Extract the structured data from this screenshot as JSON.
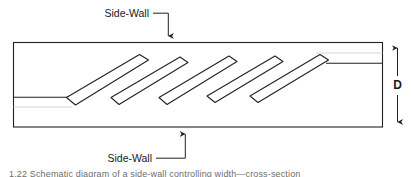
{
  "figure": {
    "type": "technical-line-diagram",
    "background_color": "#ffffff",
    "line_color": "#231f20",
    "faint_line_color": "#cfcfcf",
    "text_color": "#1a1a1a"
  },
  "labels": {
    "top_side_wall": "Side-Wall",
    "bottom_side_wall": "Side-Wall",
    "depth_dimension": "D"
  },
  "caption": {
    "text": "1.22    Schematic diagram of a side-wall controlling width—cross-section",
    "visible": "clipped-at-bottom-edge"
  },
  "geometry": {
    "duct_rect": {
      "x": 13,
      "y": 42,
      "width": 370,
      "height": 85
    },
    "left_stub_line": {
      "x1": 13,
      "y1": 97,
      "x2": 68,
      "y2": 97
    },
    "left_faint_line": {
      "x1": 13,
      "y1": 107,
      "x2": 70,
      "y2": 107
    },
    "right_stub_line": {
      "x1": 327,
      "y1": 63,
      "x2": 383,
      "y2": 63
    },
    "right_faint_line": {
      "x1": 318,
      "y1": 53,
      "x2": 383,
      "y2": 53
    },
    "blade_angle_deg": -31,
    "blade_length": 86,
    "blade_thickness": 13,
    "blades": [
      {
        "index": 1,
        "tail_x": 68,
        "tail_y": 103
      },
      {
        "index": 2,
        "tail_x": 110,
        "tail_y": 110
      },
      {
        "index": 3,
        "tail_x": 158,
        "tail_y": 110
      },
      {
        "index": 4,
        "tail_x": 206,
        "tail_y": 108
      },
      {
        "index": 5,
        "tail_x": 250,
        "tail_y": 108
      }
    ],
    "top_leader": {
      "text_anchor_x": 150,
      "text_y": 16,
      "horiz": {
        "x1": 152,
        "y1": 13,
        "x2": 168,
        "y2": 13
      },
      "vert": {
        "x1": 168,
        "y1": 13,
        "x2": 168,
        "y2": 41
      },
      "arrow": "down"
    },
    "bottom_leader": {
      "text_anchor_x": 105,
      "text_y": 162,
      "horiz": {
        "x1": 156,
        "y1": 158,
        "x2": 185,
        "y2": 158
      },
      "vert": {
        "x1": 185,
        "y1": 158,
        "x2": 185,
        "y2": 129
      },
      "arrow": "up"
    },
    "dimension_line": {
      "x": 397,
      "y_top": 43,
      "y_bottom": 127,
      "arrows": "both"
    }
  }
}
